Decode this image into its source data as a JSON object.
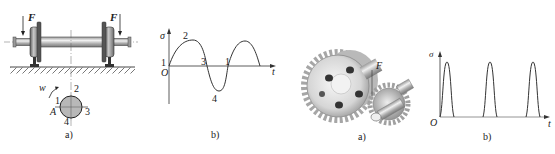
{
  "figure_left": {
    "panel_a": {
      "caption": "a)",
      "force_label": "F",
      "rotation_label": "w",
      "point_label": "A",
      "section_points": [
        "1",
        "2",
        "3",
        "4"
      ]
    },
    "panel_b": {
      "caption": "b)",
      "y_axis_label": "σ",
      "x_axis_label": "t",
      "origin_label": "O",
      "curve_labels": [
        "1",
        "2",
        "3",
        "4",
        "1"
      ]
    }
  },
  "figure_right": {
    "panel_a": {
      "caption": "a)",
      "force_label": "F"
    },
    "panel_b": {
      "caption": "b)",
      "y_axis_label": "σ",
      "x_axis_label": "t",
      "origin_label": "O",
      "pulse_count": 3
    }
  },
  "colors": {
    "line": "#333333",
    "section_fill": "#b8b8b8",
    "metal_dark": "#6e6e6e",
    "metal_light": "#d9d9d9"
  }
}
